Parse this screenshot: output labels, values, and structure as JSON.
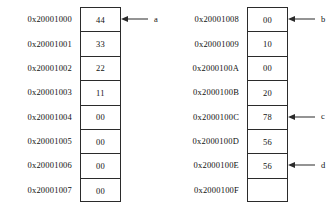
{
  "diagram": {
    "cell_width_label": "byte",
    "border_color": "#2b2b2b",
    "text_color": "#111111",
    "background": "#ffffff"
  },
  "blocks": [
    {
      "name": "left-memory-block",
      "rows": [
        {
          "address": "0x20001000",
          "value": "44",
          "pointer": "a"
        },
        {
          "address": "0x20001001",
          "value": "33",
          "pointer": ""
        },
        {
          "address": "0x20001002",
          "value": "22",
          "pointer": ""
        },
        {
          "address": "0x20001003",
          "value": "11",
          "pointer": ""
        },
        {
          "address": "0x20001004",
          "value": "00",
          "pointer": ""
        },
        {
          "address": "0x20001005",
          "value": "00",
          "pointer": ""
        },
        {
          "address": "0x20001006",
          "value": "00",
          "pointer": ""
        },
        {
          "address": "0x20001007",
          "value": "00",
          "pointer": ""
        }
      ]
    },
    {
      "name": "right-memory-block",
      "rows": [
        {
          "address": "0x20001008",
          "value": "00",
          "pointer": "b"
        },
        {
          "address": "0x20001009",
          "value": "10",
          "pointer": ""
        },
        {
          "address": "0x2000100A",
          "value": "00",
          "pointer": ""
        },
        {
          "address": "0x2000100B",
          "value": "20",
          "pointer": ""
        },
        {
          "address": "0x2000100C",
          "value": "78",
          "pointer": "c"
        },
        {
          "address": "0x2000100D",
          "value": "56",
          "pointer": ""
        },
        {
          "address": "0x2000100E",
          "value": "56",
          "pointer": "d"
        },
        {
          "address": "0x2000100F",
          "value": "",
          "pointer": ""
        }
      ]
    }
  ]
}
